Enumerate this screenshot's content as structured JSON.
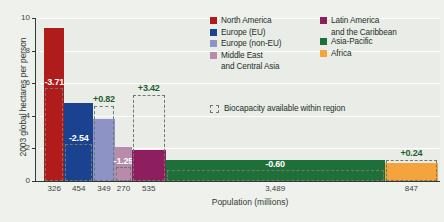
{
  "chart_data": {
    "type": "bar",
    "title": "",
    "ylabel": "2003 global hectares per person",
    "xlabel": "Population (millions)",
    "ylim": [
      0,
      10
    ],
    "yticks": [
      "0",
      "2",
      "4",
      "6",
      "8",
      "10"
    ],
    "grid": true,
    "legend_position": "top-right",
    "note": "Bar width is proportional to population; bar height is ecological footprint per person; dashed box shows biocapacity available within region.",
    "categories": [
      "North America",
      "Europe (EU)",
      "Europe (non-EU)",
      "Middle East and Central Asia",
      "Latin America and the Caribbean",
      "Asia-Pacific",
      "Africa"
    ],
    "population_millions": [
      "326",
      "454",
      "349",
      "270",
      "535",
      "3,489",
      "847"
    ],
    "population_values": [
      326,
      454,
      349,
      270,
      535,
      3489,
      847
    ],
    "footprint_values": [
      9.4,
      4.8,
      3.8,
      2.1,
      1.9,
      1.3,
      1.1
    ],
    "biocapacity_values": [
      5.7,
      2.3,
      4.6,
      0.85,
      5.3,
      0.7,
      1.3
    ],
    "deficit_labels": [
      "-3.71",
      "-2.54",
      "+0.82",
      "-1.25",
      "+3.42",
      "-0.60",
      "+0.24"
    ],
    "colors": [
      "#b01c1c",
      "#1a4290",
      "#8d93c4",
      "#b98bab",
      "#8e1f5e",
      "#1f7038",
      "#f5a33c"
    ]
  },
  "legend": {
    "column1": [
      {
        "label": "North America",
        "sub": "",
        "color": "#b01c1c"
      },
      {
        "label": "Europe (EU)",
        "sub": "",
        "color": "#1a4290"
      },
      {
        "label": "Europe (non-EU)",
        "sub": "",
        "color": "#8d93c4"
      },
      {
        "label": "Middle East",
        "sub": "and Central Asia",
        "color": "#b98bab"
      }
    ],
    "column2": [
      {
        "label": "Latin America",
        "sub": "and the Caribbean",
        "color": "#8e1f5e"
      },
      {
        "label": "Asia-Pacific",
        "sub": "",
        "color": "#1f7038"
      },
      {
        "label": "Africa",
        "sub": "",
        "color": "#f5a33c"
      }
    ],
    "biocapacity_label": "Biocapacity available within region"
  }
}
